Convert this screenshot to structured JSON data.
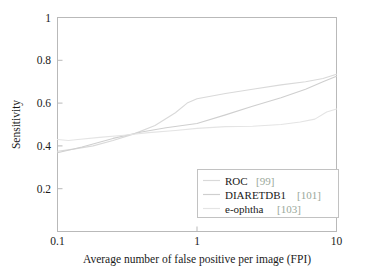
{
  "chart_data": {
    "type": "line",
    "title": "",
    "xlabel": "Average number of false positive per image (FPI)",
    "ylabel": "Sensitivity",
    "xscale": "log",
    "xlim": [
      0.1,
      10
    ],
    "ylim": [
      0.0,
      1.0
    ],
    "xticks": [
      0.1,
      1,
      10
    ],
    "xticklabels": [
      "0.1",
      "1",
      "10"
    ],
    "yticks": [
      0.2,
      0.4,
      0.6,
      0.8,
      1
    ],
    "yticklabels": [
      "0.2",
      "0.4",
      "0.6",
      "0.8",
      "1"
    ],
    "grid": false,
    "legend_position": "lower right",
    "series": [
      {
        "name": "ROC",
        "citation": "[99]",
        "color": "#d9d9d9",
        "x": [
          0.1,
          0.13,
          0.18,
          0.25,
          0.35,
          0.5,
          0.7,
          0.85,
          1.0,
          1.6,
          2.5,
          4.0,
          6.0,
          8.0,
          10.0
        ],
        "y": [
          0.375,
          0.385,
          0.4,
          0.425,
          0.455,
          0.495,
          0.555,
          0.6,
          0.62,
          0.645,
          0.665,
          0.685,
          0.7,
          0.715,
          0.735
        ]
      },
      {
        "name": "DIARETDB1",
        "citation": "[101]",
        "color": "#cfcfcf",
        "x": [
          0.1,
          0.15,
          0.25,
          0.4,
          0.6,
          1.0,
          1.6,
          2.5,
          4.0,
          6.0,
          8.0,
          10.0
        ],
        "y": [
          0.368,
          0.395,
          0.435,
          0.465,
          0.485,
          0.505,
          0.545,
          0.585,
          0.625,
          0.665,
          0.7,
          0.725
        ]
      },
      {
        "name": "e-ophtha",
        "citation": "[103]",
        "color": "#e4e4e4",
        "x": [
          0.1,
          0.12,
          0.14,
          0.2,
          0.3,
          0.45,
          0.7,
          1.0,
          1.6,
          2.5,
          4.0,
          5.5,
          7.0,
          8.5,
          10.0
        ],
        "y": [
          0.43,
          0.425,
          0.43,
          0.44,
          0.45,
          0.462,
          0.472,
          0.482,
          0.49,
          0.492,
          0.5,
          0.512,
          0.525,
          0.558,
          0.572
        ]
      }
    ]
  },
  "legend": {
    "entries": [
      {
        "label": "ROC",
        "citation": "[99]"
      },
      {
        "label": "DIARETDB1",
        "citation": "[101]"
      },
      {
        "label": "e-ophtha",
        "citation": "[103]"
      }
    ]
  },
  "axes": {
    "x_title": "Average number of false positive per image (FPI)",
    "y_title": "Sensitivity",
    "x_tick_0": "0.1",
    "x_tick_1": "1",
    "x_tick_2": "10",
    "y_tick_0": "0.2",
    "y_tick_1": "0.4",
    "y_tick_2": "0.6",
    "y_tick_3": "0.8",
    "y_tick_4": "1"
  },
  "colors": {
    "frame": "#b9b9b9",
    "citation": "#9aa89a",
    "text": "#1a1a1a",
    "background": "#ffffff"
  }
}
